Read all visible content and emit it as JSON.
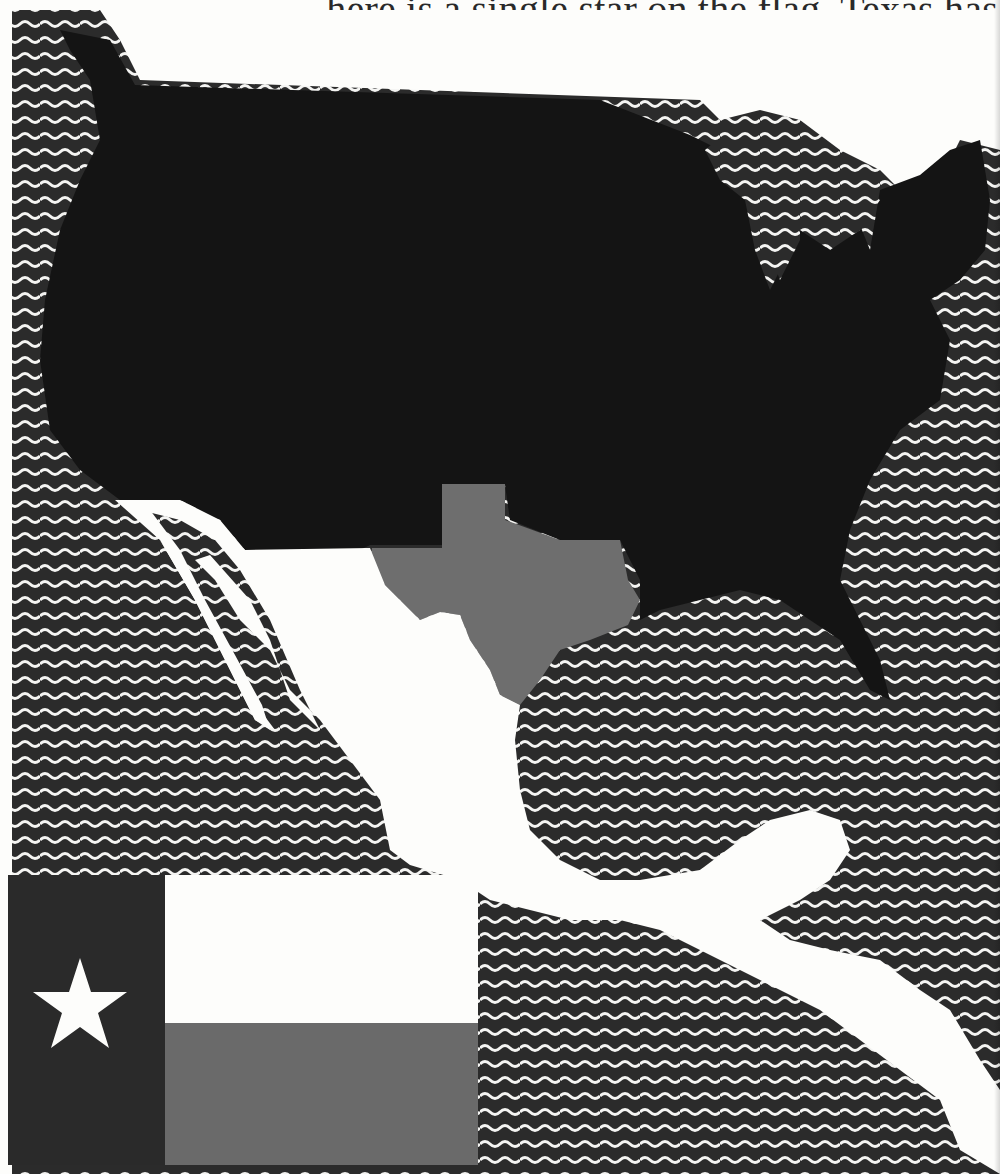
{
  "page": {
    "caption_text": "here is a single star on the flag, Texas has"
  },
  "colors": {
    "ocean_dark": "#2b2b2b",
    "ocean_wave": "#f4f4f2",
    "usa": "#141414",
    "texas": "#6e6e6e",
    "mexico": "#fdfdfb",
    "flag_blue": "#2a2a2a",
    "flag_white": "#fdfdfb",
    "flag_red": "#6a6a6a",
    "star": "#fdfdfb"
  },
  "map": {
    "regions": [
      {
        "name": "United States",
        "fill": "black"
      },
      {
        "name": "Texas",
        "fill": "gray",
        "highlighted": true
      },
      {
        "name": "Mexico and Central America",
        "fill": "white"
      },
      {
        "name": "Pacific Ocean",
        "fill": "wavy-lines"
      },
      {
        "name": "Gulf of Mexico",
        "fill": "wavy-lines"
      },
      {
        "name": "Atlantic Ocean",
        "fill": "wavy-lines"
      },
      {
        "name": "Great Lakes",
        "fill": "wavy-lines"
      }
    ]
  },
  "flag": {
    "name": "Texas flag",
    "star_count": 1,
    "stripes": [
      "white",
      "red"
    ],
    "hoist": "blue"
  }
}
